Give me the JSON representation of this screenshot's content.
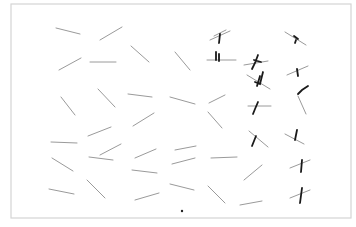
{
  "document": {
    "type": "line-cancellation-test-sheet",
    "colors": {
      "paper": "#ffffff",
      "frame": "#d4d4d4",
      "line": "#9a9a9a",
      "mark": "#1a1a1a"
    },
    "frame": {
      "x": 11,
      "y": 4,
      "width": 340,
      "height": 214
    },
    "center_dot": {
      "x": 182,
      "y": 211
    },
    "stimulus_lines": [
      [
        56,
        28,
        80,
        34
      ],
      [
        100,
        40,
        122,
        27
      ],
      [
        131,
        46,
        149,
        62
      ],
      [
        175,
        52,
        190,
        70
      ],
      [
        59,
        70,
        81,
        58
      ],
      [
        90,
        62,
        116,
        62
      ],
      [
        214,
        36,
        226,
        30
      ],
      [
        61,
        97,
        75,
        115
      ],
      [
        98,
        89,
        115,
        107
      ],
      [
        128,
        94,
        152,
        97
      ],
      [
        170,
        97,
        195,
        104
      ],
      [
        88,
        136,
        111,
        127
      ],
      [
        133,
        126,
        154,
        113
      ],
      [
        209,
        103,
        225,
        95
      ],
      [
        51,
        142,
        77,
        143
      ],
      [
        100,
        155,
        121,
        144
      ],
      [
        135,
        158,
        156,
        149
      ],
      [
        175,
        150,
        196,
        146
      ],
      [
        52,
        158,
        73,
        171
      ],
      [
        89,
        157,
        113,
        160
      ],
      [
        132,
        170,
        157,
        173
      ],
      [
        172,
        164,
        195,
        158
      ],
      [
        49,
        189,
        74,
        194
      ],
      [
        87,
        180,
        105,
        198
      ],
      [
        135,
        200,
        159,
        193
      ],
      [
        170,
        184,
        194,
        190
      ],
      [
        208,
        112,
        222,
        128
      ],
      [
        211,
        158,
        237,
        157
      ],
      [
        244,
        180,
        262,
        165
      ],
      [
        208,
        186,
        225,
        203
      ],
      [
        240,
        205,
        262,
        201
      ]
    ],
    "marked_lines": [
      {
        "line": [
          210,
          40,
          230,
          31
        ],
        "mark": "M220 34 L219 43"
      },
      {
        "line": [
          207,
          60,
          236,
          60
        ],
        "mark": "M216 52 L216 60 M219 54 L219 61"
      },
      {
        "line": [
          244,
          65,
          268,
          61
        ],
        "mark": "M258 55 L255 63 L252 69 M254 60 L261 62"
      },
      {
        "line": [
          247,
          75,
          270,
          89
        ],
        "mark": "M260 76 L257 86 M263 72 L260 84 L255 82"
      },
      {
        "line": [
          248,
          106,
          271,
          106
        ],
        "mark": "M258 102 L255 109 L253 114"
      },
      {
        "line": [
          249,
          131,
          268,
          147
        ],
        "mark": "M256 136 L252 146"
      },
      {
        "line": [
          285,
          32,
          306,
          45
        ],
        "mark": "M294 36 L298 39 M296 40 L295 43"
      },
      {
        "line": [
          287,
          75,
          308,
          66
        ],
        "mark": "M297 69 L298 76"
      },
      {
        "line": [
          298,
          96,
          306,
          114
        ],
        "mark": "M298 94 L302 90 L308 86"
      },
      {
        "line": [
          285,
          134,
          304,
          144
        ],
        "mark": "M297 130 L295 140"
      },
      {
        "line": [
          290,
          168,
          310,
          160
        ],
        "mark": "M302 160 L301 172"
      },
      {
        "line": [
          290,
          198,
          310,
          190
        ],
        "mark": "M302 188 L300 203"
      }
    ]
  }
}
